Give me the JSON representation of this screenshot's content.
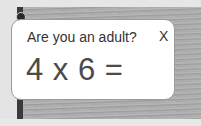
{
  "dialog": {
    "title": "Are you an adult?",
    "close_label": "X",
    "question": "4 x 6 ="
  },
  "colors": {
    "card_background": "#ffffff",
    "text": "#333333",
    "question_text": "#4a4a4a"
  }
}
